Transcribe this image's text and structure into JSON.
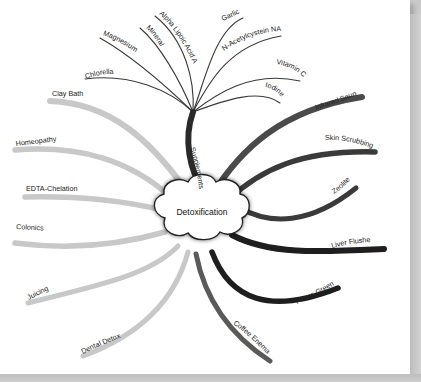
{
  "diagram": {
    "type": "mind-map",
    "central_topic": "Detoxification",
    "colors": {
      "background": "#ffffff",
      "light_branch": "#c8c8c8",
      "mid_branch": "#5a5a5a",
      "dark_branch": "#1e1e1e",
      "supplement_line": "#3a3a3a",
      "text": "#222222"
    },
    "branches": {
      "supplements": {
        "label": "Supplements",
        "children": [
          "Chlorella",
          "Magnesium",
          "Minerals",
          "Alpha Lipoic Acid ALA",
          "Garlic",
          "N-Acetylcystein NAC",
          "Vitamin C",
          "Iodine"
        ]
      },
      "right": [
        "Infrared Sauna",
        "Skin Scrubbing",
        "Zeolite",
        "Liver Flushes",
        "Fibers Greens",
        "Coffee Enemas"
      ],
      "left": [
        "Clay Bath",
        "Homeopathy",
        "EDTA-Chelation",
        "Colonics",
        "Juicing",
        "Dental Detox"
      ]
    }
  }
}
